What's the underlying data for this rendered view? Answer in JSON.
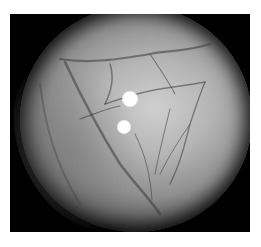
{
  "image": {
    "description": "Grayscale endoscopic view of tissue with branching blood vessels inside a circular field of view on a black background",
    "colors": {
      "background": "#ffffff",
      "frame": "#000000",
      "tissue_light": "#cfcfcf",
      "tissue_dark": "#555555",
      "vessel": "#3a3a3a",
      "highlight": "#ffffff"
    },
    "highlights": [
      {
        "label": "light-reflection-1"
      },
      {
        "label": "light-reflection-2"
      }
    ]
  }
}
